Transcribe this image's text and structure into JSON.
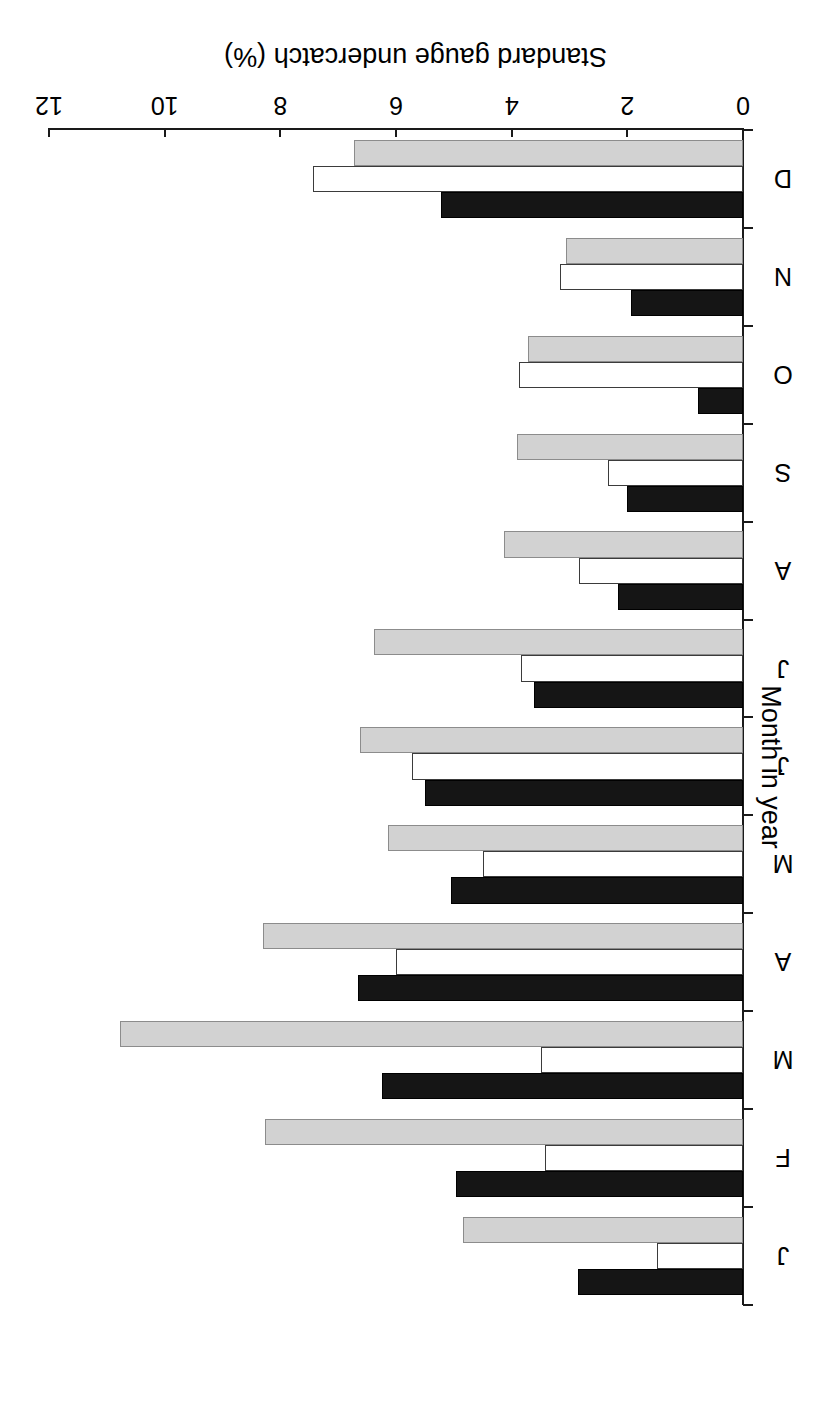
{
  "chart_data": {
    "type": "bar",
    "orientation": "horizontal-grouped",
    "title": "",
    "xlabel": "Month in year",
    "ylabel": "Standard gauge undercatch (%)",
    "ylim": [
      0,
      12
    ],
    "yticks": [
      0,
      2,
      4,
      6,
      8,
      10,
      12
    ],
    "ytick_labels": [
      "0",
      "2",
      "4",
      "6",
      "8",
      "10",
      "12"
    ],
    "grid": false,
    "legend": "none",
    "rotation_deg": 180,
    "categories": [
      "J",
      "F",
      "M",
      "A",
      "M",
      "J",
      "J",
      "A",
      "S",
      "O",
      "N",
      "D"
    ],
    "category_names": [
      "January",
      "February",
      "March",
      "April",
      "May",
      "June",
      "July",
      "August",
      "September",
      "October",
      "November",
      "December"
    ],
    "series": [
      {
        "name": "black",
        "fill": "#151515",
        "values": [
          2.85,
          4.97,
          6.25,
          6.65,
          5.05,
          5.49,
          3.62,
          2.16,
          2.01,
          0.78,
          1.94,
          5.22
        ]
      },
      {
        "name": "white",
        "fill": "#ffffff",
        "values": [
          1.49,
          3.43,
          3.5,
          6.0,
          4.5,
          5.73,
          3.84,
          2.84,
          2.33,
          3.88,
          3.17,
          7.44
        ]
      },
      {
        "name": "gray",
        "fill": "#d2d2d2",
        "values": [
          4.84,
          8.27,
          10.78,
          8.3,
          6.13,
          6.63,
          6.38,
          4.13,
          3.91,
          3.72,
          3.06,
          6.73
        ]
      }
    ]
  },
  "axes": {
    "value_axis_title": "Standard gauge undercatch (%)",
    "category_axis_title": "Month in year",
    "value_tick_labels": [
      "0",
      "2",
      "4",
      "6",
      "8",
      "10",
      "12"
    ],
    "category_tick_labels": [
      "J",
      "F",
      "M",
      "A",
      "M",
      "J",
      "J",
      "A",
      "S",
      "O",
      "N",
      "D"
    ]
  }
}
